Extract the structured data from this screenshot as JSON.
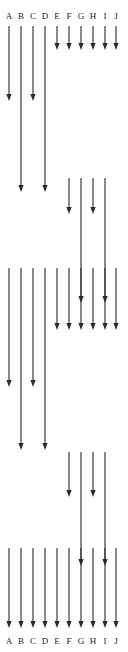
{
  "figure": {
    "width": 128,
    "height": 652,
    "background_color": "#ffffff",
    "stroke_color": "#2b2b2b",
    "label_color": "#1b1b1b"
  },
  "columns": [
    {
      "id": "A",
      "label": "A",
      "x": 9
    },
    {
      "id": "B",
      "label": "B",
      "x": 21
    },
    {
      "id": "C",
      "label": "C",
      "x": 33
    },
    {
      "id": "D",
      "label": "D",
      "x": 45
    },
    {
      "id": "E",
      "label": "E",
      "x": 57
    },
    {
      "id": "F",
      "label": "F",
      "x": 69
    },
    {
      "id": "G",
      "label": "G",
      "x": 81
    },
    {
      "id": "H",
      "label": "H",
      "x": 93
    },
    {
      "id": "I",
      "label": "I",
      "x": 105
    },
    {
      "id": "J",
      "label": "J",
      "x": 116
    }
  ],
  "header": {
    "labels": [
      "A",
      "B",
      "C",
      "D",
      "E",
      "F",
      "G",
      "H",
      "I",
      "J"
    ],
    "y": 11
  },
  "footer": {
    "labels": [
      "A",
      "B",
      "C",
      "D",
      "E",
      "F",
      "G",
      "H",
      "I",
      "J"
    ],
    "y": 636
  },
  "arrows": [
    {
      "column": "A",
      "y_start": 26,
      "y_end": 101
    },
    {
      "column": "B",
      "y_start": 26,
      "y_end": 192
    },
    {
      "column": "C",
      "y_start": 26,
      "y_end": 101
    },
    {
      "column": "D",
      "y_start": 26,
      "y_end": 192
    },
    {
      "column": "E",
      "y_start": 26,
      "y_end": 50
    },
    {
      "column": "F",
      "y_start": 26,
      "y_end": 50
    },
    {
      "column": "G",
      "y_start": 26,
      "y_end": 50
    },
    {
      "column": "H",
      "y_start": 26,
      "y_end": 50
    },
    {
      "column": "I",
      "y_start": 26,
      "y_end": 50
    },
    {
      "column": "J",
      "y_start": 26,
      "y_end": 50
    },
    {
      "column": "F",
      "y_start": 178,
      "y_end": 214
    },
    {
      "column": "G",
      "y_start": 178,
      "y_end": 303
    },
    {
      "column": "H",
      "y_start": 178,
      "y_end": 214
    },
    {
      "column": "I",
      "y_start": 178,
      "y_end": 303
    },
    {
      "column": "A",
      "y_start": 268,
      "y_end": 387
    },
    {
      "column": "B",
      "y_start": 268,
      "y_end": 450
    },
    {
      "column": "C",
      "y_start": 268,
      "y_end": 387
    },
    {
      "column": "D",
      "y_start": 268,
      "y_end": 450
    },
    {
      "column": "E",
      "y_start": 268,
      "y_end": 330
    },
    {
      "column": "F",
      "y_start": 268,
      "y_end": 330
    },
    {
      "column": "G",
      "y_start": 268,
      "y_end": 330
    },
    {
      "column": "H",
      "y_start": 268,
      "y_end": 330
    },
    {
      "column": "I",
      "y_start": 268,
      "y_end": 330
    },
    {
      "column": "J",
      "y_start": 268,
      "y_end": 330
    },
    {
      "column": "F",
      "y_start": 452,
      "y_end": 497
    },
    {
      "column": "G",
      "y_start": 452,
      "y_end": 566
    },
    {
      "column": "H",
      "y_start": 452,
      "y_end": 497
    },
    {
      "column": "I",
      "y_start": 452,
      "y_end": 566
    },
    {
      "column": "A",
      "y_start": 548,
      "y_end": 628
    },
    {
      "column": "B",
      "y_start": 548,
      "y_end": 628
    },
    {
      "column": "C",
      "y_start": 548,
      "y_end": 628
    },
    {
      "column": "D",
      "y_start": 548,
      "y_end": 628
    },
    {
      "column": "E",
      "y_start": 548,
      "y_end": 628
    },
    {
      "column": "F",
      "y_start": 548,
      "y_end": 628
    },
    {
      "column": "G",
      "y_start": 548,
      "y_end": 628
    },
    {
      "column": "H",
      "y_start": 548,
      "y_end": 628
    },
    {
      "column": "I",
      "y_start": 548,
      "y_end": 628
    },
    {
      "column": "J",
      "y_start": 548,
      "y_end": 628
    }
  ],
  "chart_data": {
    "type": "diagram",
    "categories": [
      "A",
      "B",
      "C",
      "D",
      "E",
      "F",
      "G",
      "H",
      "I",
      "J"
    ],
    "xlabel": "",
    "ylabel": "",
    "grid": false,
    "legend": "none"
  }
}
